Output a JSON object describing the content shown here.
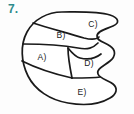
{
  "question": {
    "number": "7."
  },
  "figure": {
    "outline_color": "#1a1a1a",
    "fill_color": "#ffffff",
    "background_color": "#fdfdfd",
    "number_color": "#2e8b8b",
    "regions": [
      {
        "id": "A",
        "label": "A)",
        "x": 42,
        "y": 57
      },
      {
        "id": "B",
        "label": "B)",
        "x": 61,
        "y": 35
      },
      {
        "id": "C",
        "label": "C)",
        "x": 93,
        "y": 24
      },
      {
        "id": "D",
        "label": "D)",
        "x": 89,
        "y": 63
      },
      {
        "id": "E",
        "label": "E)",
        "x": 82,
        "y": 92
      }
    ]
  }
}
